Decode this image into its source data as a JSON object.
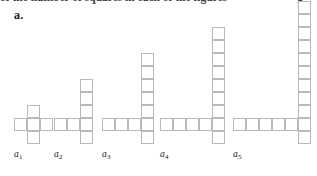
{
  "page": {
    "background_color": "#ffffff",
    "cell_stroke_color": "#b9b9bd",
    "cell_fill_color": "#ffffff",
    "text_color": "#1a1a1a"
  },
  "cropped_header": {
    "visible_fragment": "of the number of squares in each of the figures",
    "trailing_fragment": "g"
  },
  "part_label": {
    "text": "a."
  },
  "figures": [
    {
      "caption_letter": "a",
      "caption_subscript": "1",
      "caption_text": "a1",
      "square_count": 5,
      "column_height": 3,
      "row_length": 3,
      "cells": [
        {
          "col": 1,
          "row": 0
        },
        {
          "col": 0,
          "row": 1
        },
        {
          "col": 1,
          "row": 1
        },
        {
          "col": 2,
          "row": 1
        },
        {
          "col": 1,
          "row": 2
        }
      ],
      "grid_cols": 3,
      "grid_rows": 3,
      "left": 14,
      "bottom": 32
    },
    {
      "caption_letter": "a",
      "caption_subscript": "2",
      "caption_text": "a2",
      "square_count": 7,
      "column_height": 5,
      "row_length": 3,
      "cells": [
        {
          "col": 2,
          "row": 0
        },
        {
          "col": 2,
          "row": 1
        },
        {
          "col": 2,
          "row": 2
        },
        {
          "col": 0,
          "row": 3
        },
        {
          "col": 1,
          "row": 3
        },
        {
          "col": 2,
          "row": 3
        },
        {
          "col": 2,
          "row": 4
        }
      ],
      "grid_cols": 3,
      "grid_rows": 5,
      "left": 54,
      "bottom": 32
    },
    {
      "caption_letter": "a",
      "caption_subscript": "3",
      "caption_text": "a3",
      "square_count": 10,
      "column_height": 7,
      "row_length": 4,
      "cells": [
        {
          "col": 3,
          "row": 0
        },
        {
          "col": 3,
          "row": 1
        },
        {
          "col": 3,
          "row": 2
        },
        {
          "col": 3,
          "row": 3
        },
        {
          "col": 3,
          "row": 4
        },
        {
          "col": 0,
          "row": 5
        },
        {
          "col": 1,
          "row": 5
        },
        {
          "col": 2,
          "row": 5
        },
        {
          "col": 3,
          "row": 5
        },
        {
          "col": 3,
          "row": 6
        }
      ],
      "grid_cols": 4,
      "grid_rows": 7,
      "left": 102,
      "bottom": 32
    },
    {
      "caption_letter": "a",
      "caption_subscript": "4",
      "caption_text": "a4",
      "square_count": 13,
      "column_height": 9,
      "row_length": 5,
      "cells": [
        {
          "col": 4,
          "row": 0
        },
        {
          "col": 4,
          "row": 1
        },
        {
          "col": 4,
          "row": 2
        },
        {
          "col": 4,
          "row": 3
        },
        {
          "col": 4,
          "row": 4
        },
        {
          "col": 4,
          "row": 5
        },
        {
          "col": 4,
          "row": 6
        },
        {
          "col": 0,
          "row": 7
        },
        {
          "col": 1,
          "row": 7
        },
        {
          "col": 2,
          "row": 7
        },
        {
          "col": 3,
          "row": 7
        },
        {
          "col": 4,
          "row": 7
        },
        {
          "col": 4,
          "row": 8
        }
      ],
      "grid_cols": 5,
      "grid_rows": 9,
      "left": 160,
      "bottom": 32
    },
    {
      "caption_letter": "a",
      "caption_subscript": "5",
      "caption_text": "a5",
      "square_count": 16,
      "column_height": 11,
      "row_length": 6,
      "cells": [
        {
          "col": 5,
          "row": 0
        },
        {
          "col": 5,
          "row": 1
        },
        {
          "col": 5,
          "row": 2
        },
        {
          "col": 5,
          "row": 3
        },
        {
          "col": 5,
          "row": 4
        },
        {
          "col": 5,
          "row": 5
        },
        {
          "col": 5,
          "row": 6
        },
        {
          "col": 5,
          "row": 7
        },
        {
          "col": 5,
          "row": 8
        },
        {
          "col": 0,
          "row": 9
        },
        {
          "col": 1,
          "row": 9
        },
        {
          "col": 2,
          "row": 9
        },
        {
          "col": 3,
          "row": 9
        },
        {
          "col": 4,
          "row": 9
        },
        {
          "col": 5,
          "row": 9
        },
        {
          "col": 5,
          "row": 10
        }
      ],
      "grid_cols": 6,
      "grid_rows": 11,
      "left": 233,
      "bottom": 32
    }
  ],
  "geometry": {
    "cell_size_px": 13
  }
}
